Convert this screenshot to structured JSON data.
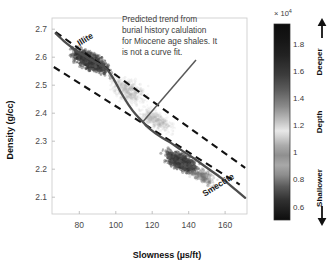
{
  "chart_data": {
    "type": "scatter",
    "title": "",
    "xlabel": "Slowness (µs/ft)",
    "ylabel": "Density (g/cc)",
    "xlim": [
      65,
      172
    ],
    "ylim": [
      2.04,
      2.74
    ],
    "xticks": [
      80,
      100,
      120,
      140,
      160
    ],
    "yticks": [
      2.1,
      2.2,
      2.3,
      2.4,
      2.5,
      2.6,
      2.7
    ],
    "grid": false,
    "legend_position": "none",
    "colormap": "gray-dark-light-dark",
    "point_color_meaning": "depth",
    "annotations": [
      {
        "name": "predicted-trend-note",
        "lines": [
          "Predicted trend from",
          "burial history calulation",
          "for Miocene age shales. It",
          "is not a curve fit."
        ],
        "leader_target": [
          115,
          2.37
        ]
      },
      {
        "name": "illite-endmember",
        "text": "Illite",
        "x": 84,
        "y": 2.655,
        "rotation": -32
      },
      {
        "name": "smectite-endmember",
        "text": "Smectite",
        "x": 157,
        "y": 2.135,
        "rotation": -32
      }
    ],
    "series": [
      {
        "name": "Predicted trend (burial history calculation)",
        "type": "line",
        "style": "solid",
        "color": "#4d4d4d",
        "points": [
          [
            67,
            2.685
          ],
          [
            72,
            2.655
          ],
          [
            78,
            2.625
          ],
          [
            84,
            2.6
          ],
          [
            90,
            2.578
          ],
          [
            95,
            2.558
          ],
          [
            99,
            2.52
          ],
          [
            103,
            2.472
          ],
          [
            107,
            2.43
          ],
          [
            111,
            2.395
          ],
          [
            115,
            2.368
          ],
          [
            119,
            2.342
          ],
          [
            124,
            2.318
          ],
          [
            130,
            2.295
          ],
          [
            136,
            2.268
          ],
          [
            143,
            2.238
          ],
          [
            150,
            2.205
          ],
          [
            158,
            2.168
          ],
          [
            166,
            2.125
          ],
          [
            171,
            2.098
          ]
        ]
      },
      {
        "name": "Upper bound trend",
        "type": "line",
        "style": "dashed",
        "color": "#111111",
        "points": [
          [
            67,
            2.69
          ],
          [
            171,
            2.205
          ]
        ]
      },
      {
        "name": "Lower bound trend",
        "type": "line",
        "style": "dashed",
        "color": "#111111",
        "points": [
          [
            66,
            2.565
          ],
          [
            168,
            2.145
          ]
        ]
      }
    ],
    "point_clusters": [
      {
        "name": "illite-rich-shallow-cluster",
        "x_center": 86,
        "y_center": 2.585,
        "x_spread": 13,
        "y_spread": 0.042,
        "n": 900,
        "shade": "dark"
      },
      {
        "name": "transition-cluster",
        "x_center": 107,
        "y_center": 2.48,
        "x_spread": 13,
        "y_spread": 0.06,
        "n": 420,
        "shade": "light"
      },
      {
        "name": "mid-slope-cluster",
        "x_center": 122,
        "y_center": 2.375,
        "x_spread": 12,
        "y_spread": 0.045,
        "n": 380,
        "shade": "light"
      },
      {
        "name": "smectite-rich-deep-cluster",
        "x_center": 136,
        "y_center": 2.225,
        "x_spread": 12,
        "y_spread": 0.04,
        "n": 800,
        "shade": "dark"
      },
      {
        "name": "sparse-tail-cluster",
        "x_center": 148,
        "y_center": 2.175,
        "x_spread": 10,
        "y_spread": 0.035,
        "n": 220,
        "shade": "mid"
      }
    ]
  },
  "colorbar": {
    "name": "depth-colorbar",
    "exponent_label": "× 10",
    "exponent_sup": "4",
    "ticks": [
      "1.8",
      "1.6",
      "1.4",
      "1.2",
      "1",
      "0.8",
      "0.6"
    ],
    "tick_values": [
      1.8,
      1.6,
      1.4,
      1.2,
      1.0,
      0.8,
      0.6
    ],
    "axis_label": "Depth",
    "top_label": "Deeper",
    "bottom_label": "Shallower",
    "top_arrow": "up-arrow",
    "bottom_arrow": "down-arrow",
    "range": [
      0.5,
      1.95
    ]
  }
}
